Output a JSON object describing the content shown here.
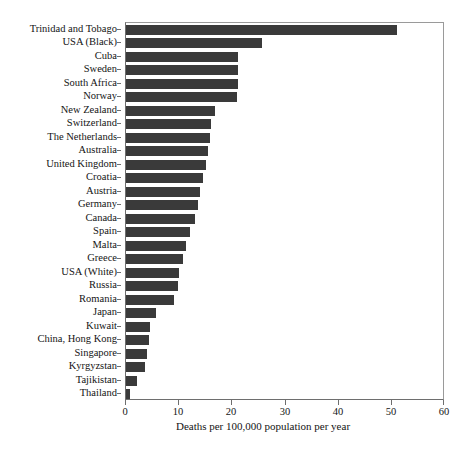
{
  "chart_data": {
    "type": "bar",
    "orientation": "horizontal",
    "title": "",
    "subtitle": "",
    "xlabel": "Deaths per 100,000 population per year",
    "ylabel": "",
    "xlim": [
      0,
      60
    ],
    "xticks": [
      0,
      10,
      20,
      30,
      40,
      50,
      60
    ],
    "xtick_labels": [
      "0",
      "10",
      "20",
      "30",
      "40",
      "50",
      "60"
    ],
    "grid": false,
    "legend": null,
    "bar_color": "#3a3a3a",
    "categories": [
      "Trinidad and Tobago",
      "USA (Black)",
      "Cuba",
      "Sweden",
      "South Africa",
      "Norway",
      "New Zealand",
      "Switzerland",
      "The Netherlands",
      "Australia",
      "United Kingdom",
      "Croatia",
      "Austria",
      "Germany",
      "Canada",
      "Spain",
      "Malta",
      "Greece",
      "USA (White)",
      "Russia",
      "Romania",
      "Japan",
      "Kuwait",
      "China, Hong Kong",
      "Singapore",
      "Kyrgyzstan",
      "Tajikistan",
      "Thailand"
    ],
    "values": [
      51.0,
      25.5,
      21.0,
      21.0,
      21.0,
      20.8,
      16.8,
      16.0,
      15.8,
      15.5,
      15.0,
      14.5,
      14.0,
      13.5,
      13.0,
      12.0,
      11.3,
      10.8,
      10.0,
      9.7,
      9.0,
      5.6,
      4.6,
      4.3,
      3.9,
      3.5,
      2.0,
      0.8
    ]
  },
  "axis": {
    "x_title": "Deaths per 100,000 population per year"
  }
}
